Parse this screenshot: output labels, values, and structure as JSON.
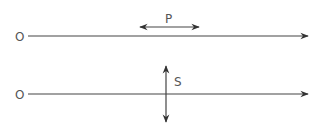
{
  "diagram": {
    "rows": [
      {
        "origin_label": "O",
        "wave_label": "P",
        "polarization": "longitudinal",
        "line_y": 36
      },
      {
        "origin_label": "O",
        "wave_label": "S",
        "polarization": "transverse",
        "line_y": 94
      }
    ],
    "colors": {
      "line": "#444444",
      "text": "#555555",
      "background": "#ffffff"
    }
  }
}
